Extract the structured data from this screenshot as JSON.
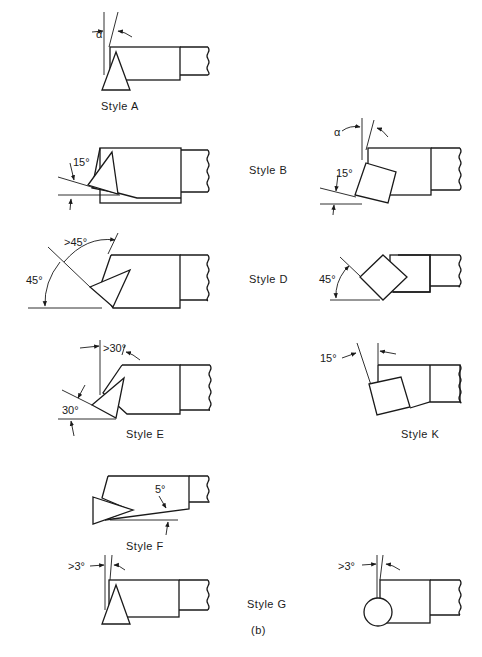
{
  "figure": {
    "caption": "(b)",
    "styles": [
      {
        "id": "A",
        "label": "Style A",
        "angles": [
          "α"
        ]
      },
      {
        "id": "B",
        "label": "Style B",
        "angles": [
          "15°",
          "α",
          "15°"
        ]
      },
      {
        "id": "D",
        "label": "Style D",
        "angles": [
          ">45°",
          "45°",
          "45°"
        ]
      },
      {
        "id": "E",
        "label": "Style E",
        "angles": [
          ">30°",
          "30°"
        ]
      },
      {
        "id": "K",
        "label": "Style K",
        "angles": [
          "15°"
        ]
      },
      {
        "id": "F",
        "label": "Style F",
        "angles": [
          "5°"
        ]
      },
      {
        "id": "G",
        "label": "Style G",
        "angles": [
          ">3°",
          ">3°"
        ]
      }
    ]
  },
  "labels": {
    "a": "Style A",
    "b": "Style B",
    "d": "Style D",
    "e": "Style E",
    "k": "Style K",
    "f": "Style F",
    "g": "Style G",
    "caption": "(b)"
  },
  "angles": {
    "a_alpha": "α",
    "b_left_15": "15°",
    "b_right_alpha": "α",
    "b_right_15": "15°",
    "d_left_gt45": ">45°",
    "d_left_45": "45°",
    "d_right_45": "45°",
    "e_gt30": ">30°",
    "e_30": "30°",
    "k_15": "15°",
    "f_5": "5°",
    "g_left_gt3": ">3°",
    "g_right_gt3": ">3°"
  }
}
